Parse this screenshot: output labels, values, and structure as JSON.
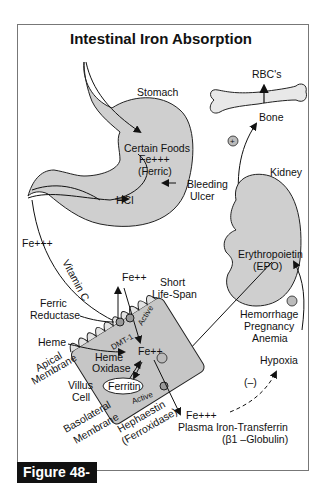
{
  "title": "Intestinal Iron Absorption",
  "figure_label": "Figure 48-2",
  "labels": {
    "stomach": "Stomach",
    "certain_foods": "Certain Foods",
    "fe3_stomach": "Fe+++",
    "ferric": "(Ferric)",
    "bleeding": "Bleeding",
    "ulcer": "Ulcer",
    "hcl": "HCl",
    "rbcs": "RBC's",
    "bone": "Bone",
    "kidney": "Kidney",
    "epo1": "Erythropoietin",
    "epo2": "(EPO)",
    "fe3_left": "Fe+++",
    "vitamin_c": "Vitamin C",
    "fe2_top": "Fe++",
    "short": "Short",
    "life_span": "Life-Span",
    "ferric_red1": "Ferric",
    "ferric_red2": "Reductase",
    "heme": "Heme",
    "apical1": "Apical",
    "apical2": "Membrane",
    "dmt1": "DMT-1",
    "active_top": "Active",
    "fe2_center": "Fe++",
    "heme_ox1": "Heme",
    "heme_ox2": "Oxidase",
    "ferritin": "Ferritin",
    "villus1": "Villus",
    "villus2": "Cell",
    "active_bottom": "Active",
    "baso1": "Basolateral",
    "baso2": "Membrane",
    "heph1": "Hephaestin",
    "heph2": "(Ferroxidase)",
    "hemorrhage": "Hemorrhage",
    "pregnancy": "Pregnancy",
    "anemia": "Anemia",
    "hypoxia": "Hypoxia",
    "minus": "(–)",
    "fe3_plasma": "Fe+++",
    "plasma": "Plasma Iron-Transferrin",
    "globulin": "(β1 –Globulin)"
  }
}
